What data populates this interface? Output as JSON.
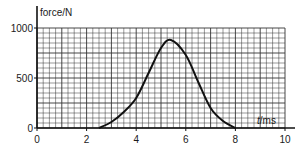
{
  "chart_data": {
    "type": "line",
    "title": "",
    "xlabel": "t/ms",
    "ylabel": "force/N",
    "xlim": [
      0,
      10
    ],
    "ylim": [
      0,
      1000
    ],
    "grid": true,
    "legend": null,
    "x_ticks": [
      0,
      2,
      4,
      6,
      8,
      10
    ],
    "y_ticks": [
      0,
      500,
      1000
    ],
    "x_tick_labels": [
      "0",
      "2",
      "4",
      "6",
      "8",
      "10"
    ],
    "y_tick_labels": [
      "0",
      "500",
      "1000"
    ],
    "series": [
      {
        "name": "force",
        "x": [
          0,
          2.5,
          3.0,
          3.5,
          4.0,
          4.5,
          5.0,
          5.4,
          6.0,
          6.5,
          7.0,
          7.5,
          8.0
        ],
        "values": [
          0,
          0,
          60,
          160,
          300,
          550,
          800,
          880,
          730,
          460,
          200,
          70,
          0
        ]
      }
    ],
    "colors": {
      "grid": "#2a2a2a",
      "curve": "#111111",
      "axis": "#111111"
    }
  }
}
